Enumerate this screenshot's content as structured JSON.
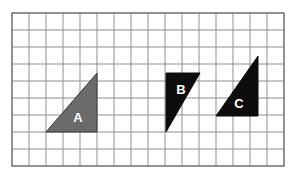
{
  "figure": {
    "background_color": "#ffffff",
    "grid": {
      "origin_x": 12,
      "origin_y": 13,
      "cell_size": 17,
      "cols": 16,
      "columns": 16,
      "rows": 9,
      "line_color": "#8f8f8f",
      "border_color": "#6e6e6e",
      "line_width": 1,
      "border_width": 1.2,
      "show_grid": true
    },
    "shapes": [
      {
        "id": "triangle-a",
        "label": "A",
        "kind": "right-triangle",
        "fill": "#6a6a6a",
        "stroke": "#3a3a3a",
        "stroke_width": 1,
        "label_color": "#ffffff",
        "right_angle_corner": "bottom-right",
        "points": "46,132 97,132 97,73",
        "base_cells": 3,
        "height_cells": 3.5,
        "label_x": 78,
        "label_y": 119
      },
      {
        "id": "triangle-b",
        "label": "B",
        "kind": "right-triangle",
        "fill": "#0d0d0d",
        "stroke": "#0d0d0d",
        "stroke_width": 1,
        "label_color": "#ffffff",
        "right_angle_corner": "top-left",
        "points": "166,73 200,73 166,132",
        "base_cells": 2,
        "height_cells": 3.5,
        "label_x": 181,
        "label_y": 91
      },
      {
        "id": "triangle-c",
        "label": "C",
        "kind": "right-triangle",
        "fill": "#0d0d0d",
        "stroke": "#0d0d0d",
        "stroke_width": 1,
        "label_color": "#ffffff",
        "right_angle_corner": "bottom-right",
        "points": "216,116 258,116 258,56",
        "base_cells": 2.5,
        "height_cells": 3.5,
        "label_x": 239,
        "label_y": 105
      }
    ]
  }
}
